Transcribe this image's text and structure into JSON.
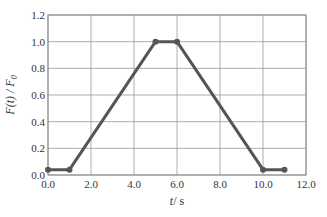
{
  "chart_data": {
    "type": "line",
    "title": "",
    "xlabel": "t / s",
    "ylabel": "F(t) / F0",
    "xlim": [
      0,
      12
    ],
    "ylim": [
      0,
      1.2
    ],
    "grid": true,
    "x_ticks": [
      "0.0",
      "2.0",
      "4.0",
      "6.0",
      "8.0",
      "10.0",
      "12.0"
    ],
    "y_ticks": [
      "0.0",
      "0.2",
      "0.4",
      "0.6",
      "0.8",
      "1.0",
      "1.2"
    ],
    "series": [
      {
        "name": "F(t)/F0",
        "color": "#555555",
        "x": [
          0,
          1,
          5,
          6,
          10,
          11
        ],
        "y": [
          0.04,
          0.04,
          1.0,
          1.0,
          0.04,
          0.04
        ]
      }
    ]
  },
  "labels": {
    "xlabel_t": "t",
    "xlabel_unit": "/ s",
    "ylabel_main": "F(t) / F",
    "ylabel_sub": "0"
  }
}
